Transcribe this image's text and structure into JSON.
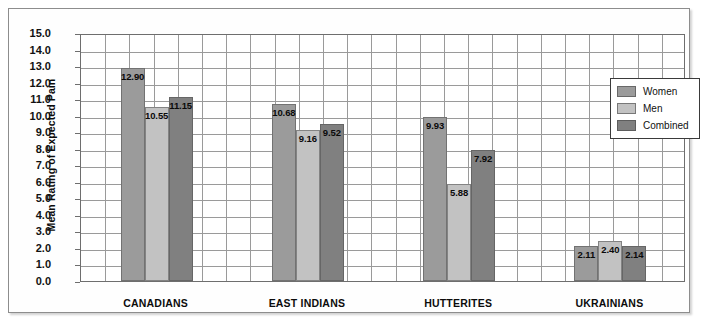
{
  "chart_data": {
    "type": "bar",
    "title": "",
    "xlabel": "",
    "ylabel": "Mean Rating of Expected Pain",
    "ylim": [
      0,
      15
    ],
    "ytick_step": 1,
    "grid": true,
    "legend_position": "top-right",
    "categories": [
      "CANADIANS",
      "EAST INDIANS",
      "HUTTERITES",
      "UKRAINIANS"
    ],
    "series": [
      {
        "name": "Women",
        "color": "#9b9b9b",
        "values": [
          12.9,
          10.68,
          9.93,
          2.11
        ]
      },
      {
        "name": "Men",
        "color": "#c2c2c2",
        "values": [
          10.55,
          9.16,
          5.88,
          2.4
        ]
      },
      {
        "name": "Combined",
        "color": "#808080",
        "values": [
          11.15,
          9.52,
          7.92,
          2.14
        ]
      }
    ],
    "value_labels": [
      [
        "12.90",
        "10.55",
        "11.15"
      ],
      [
        "10.68",
        "9.16",
        "9.52"
      ],
      [
        "9.93",
        "5.88",
        "7.92"
      ],
      [
        "2.11",
        "2.40",
        "2.14"
      ]
    ],
    "ytick_labels": [
      "15.0",
      "14.0",
      "13.0",
      "12.0",
      "11.0",
      "10.0",
      "9.0",
      "8.0",
      "7.0",
      "6.0",
      "5.0",
      "4.0",
      "3.0",
      "2.0",
      "1.0",
      "0.0"
    ]
  },
  "legend": {
    "items": [
      {
        "label": "Women"
      },
      {
        "label": "Men"
      },
      {
        "label": "Combined"
      }
    ]
  }
}
